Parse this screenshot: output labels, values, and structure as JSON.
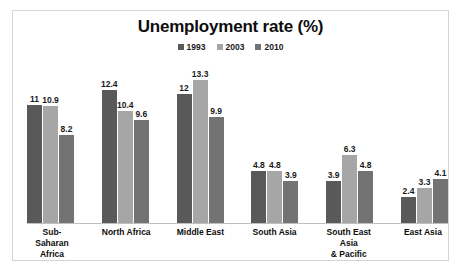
{
  "chart_data": {
    "type": "bar",
    "title": "Unemployment rate (%)",
    "xlabel": "",
    "ylabel": "",
    "ylim": [
      0,
      14
    ],
    "grid": false,
    "legend_position": "top-center",
    "categories": [
      "Sub-Saharan\nAfrica",
      "North Africa",
      "Middle East",
      "South Asia",
      "South East Asia\n& Pacific",
      "East Asia"
    ],
    "series": [
      {
        "name": "1993",
        "color": "#595959",
        "values": [
          11,
          12.4,
          12,
          4.8,
          3.9,
          2.4
        ],
        "labels": [
          "11",
          "12.4",
          "12",
          "4.8",
          "3.9",
          "2.4"
        ]
      },
      {
        "name": "2003",
        "color": "#a6a6a6",
        "values": [
          10.9,
          10.4,
          13.3,
          4.8,
          6.3,
          3.3
        ],
        "labels": [
          "10.9",
          "10.4",
          "13.3",
          "4.8",
          "6.3",
          "3.3"
        ]
      },
      {
        "name": "2010",
        "color": "#737373",
        "values": [
          8.2,
          9.6,
          9.9,
          3.9,
          4.8,
          4.1
        ],
        "labels": [
          "8.2",
          "9.6",
          "9.9",
          "3.9",
          "4.8",
          "4.1"
        ]
      }
    ]
  },
  "frame": {
    "border_color": "#d4d4d4",
    "background": "#ffffff"
  }
}
